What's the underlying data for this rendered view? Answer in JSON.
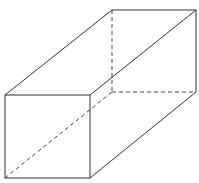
{
  "diagram": {
    "type": "cuboid",
    "colors": {
      "background": "#ffffff",
      "edge": "#333333",
      "hidden_edge": "#444444"
    },
    "vertices": {
      "front_top_left": [
        5,
        95
      ],
      "front_top_right": [
        90,
        95
      ],
      "front_bottom_left": [
        5,
        178
      ],
      "front_bottom_right": [
        90,
        178
      ],
      "back_top_left": [
        112,
        10
      ],
      "back_top_right": [
        196,
        10
      ],
      "back_bottom_left": [
        112,
        92
      ],
      "back_bottom_right": [
        196,
        92
      ]
    },
    "visible_edges": 9,
    "hidden_edges": 3
  }
}
